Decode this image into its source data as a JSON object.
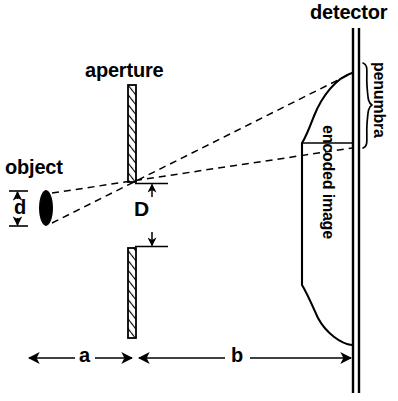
{
  "figure": {
    "kind": "optics-pinhole-camera-diagram",
    "width": 398,
    "height": 401,
    "background_color": "#ffffff",
    "line_color": "#000000"
  },
  "labels": {
    "detector": "detector",
    "aperture": "aperture",
    "object": "object",
    "penumbra": "penumbra",
    "encoded_image": "encoded image",
    "object_size": "d",
    "aperture_diameter": "D",
    "distance_object_to_aperture": "a",
    "distance_aperture_to_detector": "b"
  },
  "elements": {
    "object": {
      "name": "object",
      "shape": "filled-ellipse",
      "color": "#000000",
      "center_x": 46,
      "center_y": 208,
      "rx": 6,
      "ry": 17
    },
    "aperture": {
      "name": "aperture-plate",
      "fill": "hatched",
      "x": 128,
      "top_bar": {
        "y_top": 85,
        "y_bottom": 182
      },
      "bottom_bar": {
        "y_top": 248,
        "y_bottom": 338
      },
      "bar_width": 8,
      "gap_label": "D"
    },
    "detector": {
      "name": "detector-plane",
      "style": "double-line",
      "x_outer": 352,
      "x_inner": 358,
      "y_top": 28,
      "y_bottom": 393
    },
    "rays": {
      "style": "dashed",
      "count": 4,
      "description": "two crossing ray pairs from object edges through aperture to detector"
    },
    "encoded_image_profile": {
      "name": "encoded-image-intensity-profile",
      "style": "solid-curve",
      "top_at_detector_y": 73,
      "plateau_x": 302,
      "plateau_top_y": 143,
      "plateau_bottom_y": 285,
      "bottom_at_detector_y": 345
    },
    "penumbra_brace": {
      "name": "penumbra-brace",
      "x": 362,
      "y_top": 63,
      "y_bottom": 148
    },
    "dimension_a": {
      "y": 358,
      "x_start": 28,
      "x_end": 133,
      "arrows": "both"
    },
    "dimension_b": {
      "y": 358,
      "x_start": 139,
      "x_end": 352,
      "arrows": "both"
    },
    "dimension_d": {
      "x": 17,
      "y_top": 191,
      "y_bottom": 226,
      "arrows": "both-ticks"
    },
    "dimension_D": {
      "x": 152,
      "y_top": 183,
      "y_bottom": 247,
      "arrows": "both"
    }
  }
}
